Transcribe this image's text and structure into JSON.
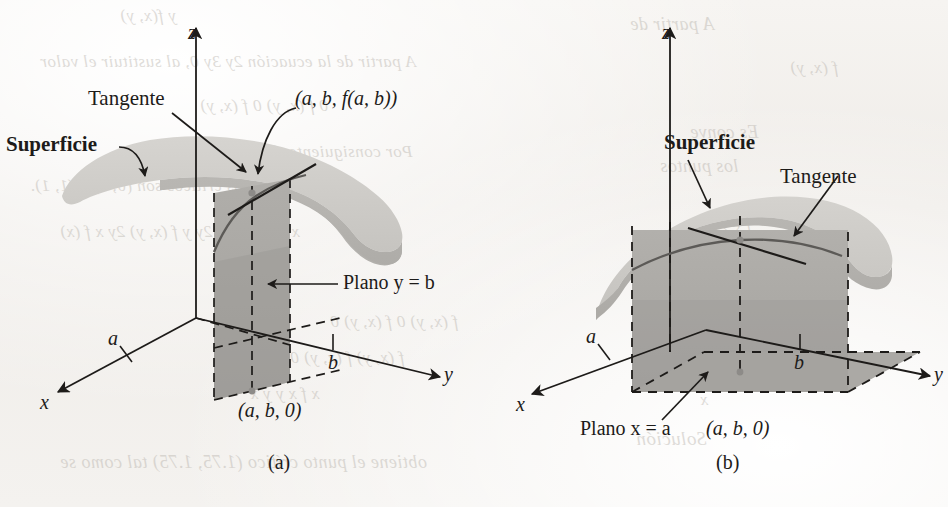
{
  "figure": {
    "kind": "textbook-figure",
    "captions": {
      "left": "(a)",
      "right": "(b)"
    }
  },
  "colors": {
    "paper": "#f3f1ee",
    "ink": "#1d1b19",
    "surface_light": "#cfcdc9",
    "surface_mid": "#bcbab6",
    "plane_fill": "#a9a7a3",
    "plane_fill_light": "#b6b4b0",
    "ghost_text": "#b9b4ad"
  },
  "panel_a": {
    "caption": "(a)",
    "axes": {
      "z": "z",
      "x": "x",
      "y": "y"
    },
    "ticks": {
      "x_tick": "a",
      "y_tick": "b"
    },
    "labels": {
      "surface": "Superficie",
      "tangent": "Tangente",
      "point_on_surface": "(a, b, f(a, b))",
      "plane": "Plano y = b",
      "point_on_floor": "(a, b, 0)"
    }
  },
  "panel_b": {
    "caption": "(b)",
    "axes": {
      "z": "z",
      "x": "x",
      "y": "y"
    },
    "ticks": {
      "x_tick": "a",
      "y_tick": "b"
    },
    "labels": {
      "surface": "Superficie",
      "tangent": "Tangente",
      "plane": "Plano x = a",
      "point_on_floor": "(a, b, 0)"
    }
  },
  "bleed_through": {
    "items": [
      {
        "text": "y  f(x, y)",
        "x": 120,
        "y": 6,
        "size": 17
      },
      {
        "text": "A partir de la ecuación  2y   3y   0, al sustituir el valor",
        "x": 40,
        "y": 52,
        "size": 17
      },
      {
        "text": "0  f  (x, y)    0  f  (x, y)",
        "x": 200,
        "y": 96,
        "size": 17
      },
      {
        "text": "Por consiguiente, f  (0, 0)  0,  f  (0, 0)  0 y",
        "x": 130,
        "y": 142,
        "size": 17
      },
      {
        "text": "los puntos críticos son (0, 0) y (1, 1).",
        "x": 30,
        "y": 176,
        "size": 17
      },
      {
        "text": "x  f (x, y)  2x   2y    y  f (x, y)  2y   x   f (x)",
        "x": 60,
        "y": 222,
        "size": 17
      },
      {
        "text": "Solución",
        "x": 220,
        "y": 270,
        "size": 19
      },
      {
        "text": "f  (x, y)  0   f  (x, y)  0",
        "x": 330,
        "y": 312,
        "size": 17
      },
      {
        "text": "f  (x, y)    f  (x, y)    0",
        "x": 290,
        "y": 348,
        "size": 17
      },
      {
        "text": "x  f  x  y   y  x",
        "x": 250,
        "y": 384,
        "size": 17
      },
      {
        "text": "obtiene el punto crítico  (1.75, 1.75)  tal como se",
        "x": 60,
        "y": 452,
        "size": 18
      },
      {
        "text": "A partir de",
        "x": 630,
        "y": 14,
        "size": 18
      },
      {
        "text": "f  (x, y)",
        "x": 790,
        "y": 58,
        "size": 17
      },
      {
        "text": "Es conve",
        "x": 690,
        "y": 122,
        "size": 18
      },
      {
        "text": "los puntos",
        "x": 660,
        "y": 156,
        "size": 18
      },
      {
        "text": "f (x)",
        "x": 720,
        "y": 212,
        "size": 17
      },
      {
        "text": "Solución",
        "x": 640,
        "y": 266,
        "size": 19
      },
      {
        "text": "x",
        "x": 700,
        "y": 390,
        "size": 17
      },
      {
        "text": "Solución",
        "x": 636,
        "y": 428,
        "size": 19
      }
    ]
  }
}
